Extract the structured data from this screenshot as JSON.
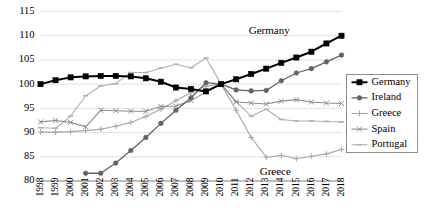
{
  "chart_data": {
    "type": "line",
    "title": "",
    "subtitle": "",
    "xlabel": "",
    "ylabel": "",
    "grid": true,
    "legend_position": "right",
    "x": [
      1998,
      1999,
      2000,
      2001,
      2002,
      2003,
      2004,
      2005,
      2006,
      2007,
      2008,
      2009,
      2010,
      2011,
      2012,
      2013,
      2014,
      2015,
      2016,
      2017,
      2018
    ],
    "xtick_labels": [
      "1998",
      "1999",
      "2000",
      "2001",
      "2002",
      "2003",
      "2004",
      "2005",
      "2006",
      "2007",
      "2008",
      "2009",
      "2010",
      "2011",
      "2012",
      "2013",
      "2014",
      "2015",
      "2016",
      "2017",
      "2018"
    ],
    "ylim": [
      80,
      115
    ],
    "ytick_labels": [
      "80",
      "85",
      "90",
      "95",
      "100",
      "105",
      "110",
      "115"
    ],
    "ytick_values": [
      80,
      85,
      90,
      95,
      100,
      105,
      110,
      115
    ],
    "xlim": [
      1998,
      2018
    ],
    "series": [
      {
        "name": "Germany",
        "color": "#000000",
        "marker": "square",
        "line_width": 2.0,
        "values": [
          100.0,
          100.8,
          101.4,
          101.6,
          101.7,
          101.7,
          101.6,
          101.2,
          100.5,
          99.3,
          99.0,
          98.5,
          100.0,
          101.0,
          102.1,
          103.2,
          104.4,
          105.5,
          106.7,
          108.4,
          110.0
        ]
      },
      {
        "name": "Ireland",
        "color": "#636363",
        "marker": "circle",
        "line_width": 1.3,
        "values": [
          null,
          null,
          null,
          81.6,
          81.6,
          83.7,
          86.3,
          89.0,
          91.9,
          94.6,
          97.2,
          100.3,
          100.0,
          98.8,
          98.6,
          98.7,
          100.7,
          102.3,
          103.2,
          104.6,
          106.0
        ]
      },
      {
        "name": "Greece",
        "color": "#a6a6a6",
        "marker": "plus",
        "line_width": 1.1,
        "values": [
          90.1,
          90.1,
          90.2,
          90.4,
          90.7,
          91.3,
          92.1,
          93.3,
          94.8,
          96.6,
          98.2,
          99.6,
          100.0,
          94.6,
          89.0,
          84.9,
          85.3,
          84.6,
          85.1,
          85.6,
          86.5
        ]
      },
      {
        "name": "Spain",
        "color": "#8c8c8c",
        "marker": "x",
        "line_width": 1.1,
        "values": [
          92.2,
          92.5,
          92.1,
          91.2,
          94.6,
          94.5,
          94.4,
          94.4,
          95.4,
          95.5,
          96.6,
          98.4,
          100.0,
          96.3,
          96.1,
          95.9,
          96.5,
          96.8,
          96.3,
          96.1,
          96.0
        ]
      },
      {
        "name": "Portugal",
        "color": "#b0b0b0",
        "marker": "dash",
        "line_width": 1.1,
        "values": [
          91.0,
          90.9,
          93.4,
          97.6,
          99.6,
          100.1,
          102.4,
          102.4,
          103.3,
          104.1,
          103.4,
          105.4,
          100.0,
          96.4,
          93.4,
          94.8,
          92.7,
          92.4,
          92.4,
          92.3,
          92.2
        ]
      }
    ],
    "annotations": [
      {
        "text": "Germany",
        "x": 2013.2,
        "y": 110.4
      },
      {
        "text": "Greece",
        "x": 2013.6,
        "y": 81.3
      }
    ],
    "legend_entries": [
      {
        "label": "Germany"
      },
      {
        "label": "Ireland"
      },
      {
        "label": "Greece"
      },
      {
        "label": "Spain"
      },
      {
        "label": "Portugal"
      }
    ]
  }
}
